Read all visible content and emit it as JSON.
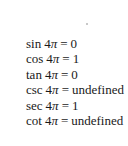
{
  "equations": [
    {
      "fn": "sin",
      "coef": "4",
      "sym": "π",
      "op": "=",
      "value": "0"
    },
    {
      "fn": "cos",
      "coef": "4",
      "sym": "π",
      "op": "=",
      "value": "1"
    },
    {
      "fn": "tan",
      "coef": "4",
      "sym": "π",
      "op": "=",
      "value": "0"
    },
    {
      "fn": "csc",
      "coef": "4",
      "sym": "π",
      "op": "=",
      "value": "undefined"
    },
    {
      "fn": "sec",
      "coef": "4",
      "sym": "π",
      "op": "=",
      "value": "1"
    },
    {
      "fn": "cot",
      "coef": "4",
      "sym": "π",
      "op": "=",
      "value": "undefined"
    }
  ]
}
